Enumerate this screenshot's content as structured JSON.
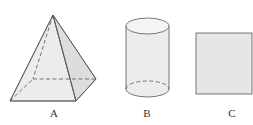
{
  "figure": {
    "shapes": [
      {
        "id": "A",
        "label": "A",
        "type": "square pyramid"
      },
      {
        "id": "B",
        "label": "B",
        "type": "cylinder"
      },
      {
        "id": "C",
        "label": "C",
        "type": "square"
      }
    ],
    "colors": {
      "stroke": "#555555",
      "fill": "#e8e8e8",
      "fill_dark": "#dcdcdc"
    }
  }
}
